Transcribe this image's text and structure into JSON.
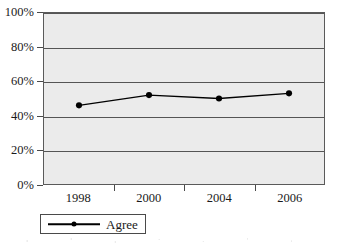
{
  "chart_data": {
    "type": "line",
    "title": "",
    "xlabel": "",
    "ylabel": "",
    "categories": [
      "1998",
      "2000",
      "2004",
      "2006"
    ],
    "values": [
      46,
      52,
      50,
      53
    ],
    "series": [
      {
        "name": "Agree",
        "values": [
          46,
          52,
          50,
          53
        ]
      }
    ],
    "ylim": [
      0,
      100
    ],
    "y_ticks": [
      0,
      20,
      40,
      60,
      80,
      100
    ],
    "y_tick_labels": [
      "0%",
      "20%",
      "40%",
      "60%",
      "80%",
      "100%"
    ],
    "x_tick_labels": [
      "1998",
      "2000",
      "2004",
      "2006"
    ],
    "grid": true,
    "grid_axis": "y",
    "legend": [
      "Agree"
    ],
    "legend_position": "bottom-left",
    "value_format": "percent",
    "marker": "filled-circle",
    "plot_background": "#ebebeb",
    "series_color": "#000000",
    "gridline_color": "#555555",
    "axis_color": "#4a4a4a"
  },
  "legend": {
    "entries": [
      {
        "label": "Agree"
      }
    ]
  }
}
